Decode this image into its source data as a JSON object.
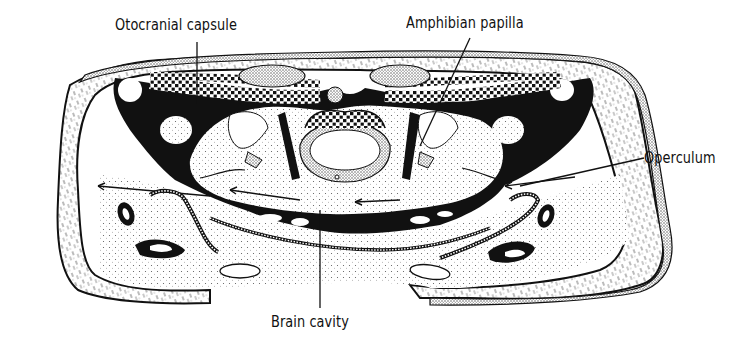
{
  "figure": {
    "labels": {
      "otocranial_capsule": "Otocranial capsule",
      "amphibian_papilla": "Amphibian papilla",
      "operculum": "Operculum",
      "brain_cavity": "Brain cavity"
    },
    "colors": {
      "ink": "#111111",
      "paper": "#ffffff",
      "stipple": "#e9e9e9"
    }
  }
}
